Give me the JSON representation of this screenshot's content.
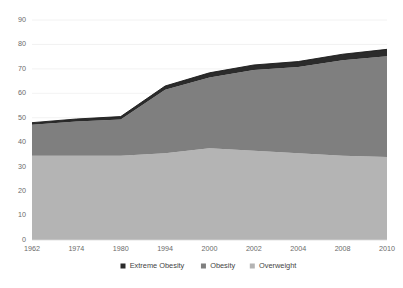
{
  "chart_data": {
    "type": "area",
    "stacked": true,
    "title": "",
    "subtitle": "",
    "xlabel": "",
    "ylabel": "",
    "categories": [
      "1962",
      "1974",
      "1980",
      "1994",
      "2000",
      "2002",
      "2004",
      "2008",
      "2010"
    ],
    "ylim": [
      0,
      90
    ],
    "ytick_values": [
      0,
      10,
      20,
      30,
      40,
      50,
      60,
      70,
      80,
      90
    ],
    "ytick_labels": [
      "0",
      "10",
      "20",
      "30",
      "40",
      "50",
      "60",
      "70",
      "80",
      "90"
    ],
    "grid": true,
    "grid_axis": "y",
    "legend_position": "bottom",
    "series": [
      {
        "name": "Overweight",
        "color": "#b4b4b4",
        "values": [
          34.5,
          34.5,
          34.5,
          35.5,
          37.5,
          36.5,
          35.5,
          34.5,
          34.0
        ]
      },
      {
        "name": "Obesity",
        "color": "#7f7f7f",
        "values": [
          12.6,
          14.0,
          14.8,
          26.0,
          29.0,
          33.0,
          35.3,
          39.0,
          41.2
        ]
      },
      {
        "name": "Extreme Obesity",
        "color": "#2b2b2b",
        "values": [
          0.9,
          1.0,
          1.2,
          1.5,
          1.9,
          2.1,
          2.2,
          2.5,
          2.8
        ]
      }
    ],
    "stacked_totals": [
      48.0,
      49.5,
      50.5,
      63.0,
      68.4,
      71.6,
      73.0,
      76.0,
      78.0
    ],
    "legend_entries": [
      {
        "label": "Extreme Obesity",
        "color": "#2b2b2b"
      },
      {
        "label": "Obesity",
        "color": "#7f7f7f"
      },
      {
        "label": "Overweight",
        "color": "#b4b4b4"
      }
    ]
  },
  "plot": {
    "left": 32,
    "right": 387,
    "top": 20,
    "bottom": 240
  },
  "legend": {
    "y": 266,
    "marker_size": 5
  }
}
